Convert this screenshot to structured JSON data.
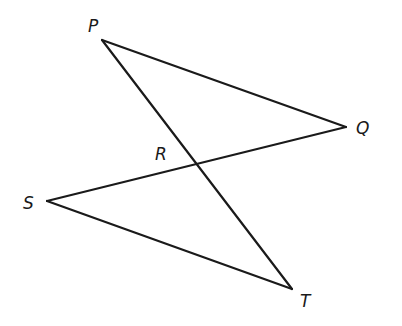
{
  "diagram": {
    "type": "geometry-figure",
    "points": {
      "P": {
        "label": "P",
        "x": 102,
        "y": 40
      },
      "Q": {
        "label": "Q",
        "x": 346,
        "y": 127
      },
      "R": {
        "label": "R",
        "x": 197,
        "y": 164
      },
      "S": {
        "label": "S",
        "x": 47,
        "y": 201
      },
      "T": {
        "label": "T",
        "x": 292,
        "y": 289
      }
    },
    "segments": [
      {
        "from": "P",
        "to": "Q"
      },
      {
        "from": "P",
        "to": "T"
      },
      {
        "from": "Q",
        "to": "S"
      },
      {
        "from": "S",
        "to": "T"
      }
    ],
    "labels": {
      "P": "P",
      "Q": "Q",
      "R": "R",
      "S": "S",
      "T": "T"
    },
    "line_color": "#1a1a1a",
    "background": "#ffffff"
  }
}
